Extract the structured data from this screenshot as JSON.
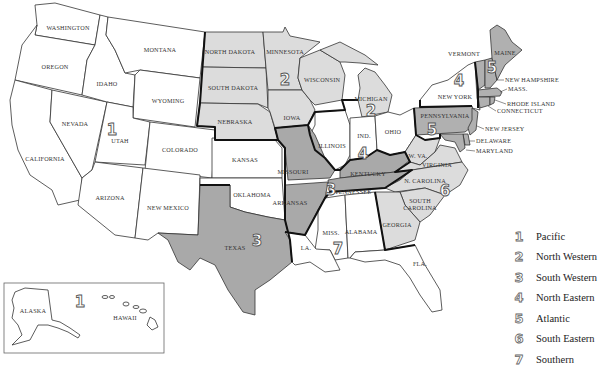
{
  "map": {
    "title": "Map of the United States showing seven regions",
    "colors": {
      "region_1": "#ffffff",
      "region_2": "#dcdcdc",
      "region_3": "#a9a9a9",
      "region_4": "#ffffff",
      "region_5": "#b0b0b0",
      "region_6": "#dcdcdc",
      "region_7": "#ffffff",
      "border": "#111111",
      "state_line": "#333333"
    },
    "states": [
      {
        "name": "WASHINGTON",
        "region": 1
      },
      {
        "name": "OREGON",
        "region": 1
      },
      {
        "name": "CALIFORNIA",
        "region": 1
      },
      {
        "name": "IDAHO",
        "region": 1
      },
      {
        "name": "NEVADA",
        "region": 1
      },
      {
        "name": "UTAH",
        "region": 1
      },
      {
        "name": "MONTANA",
        "region": 1
      },
      {
        "name": "WYOMING",
        "region": 1
      },
      {
        "name": "COLORADO",
        "region": 1
      },
      {
        "name": "ARIZONA",
        "region": 1
      },
      {
        "name": "NEW MEXICO",
        "region": 1
      },
      {
        "name": "KANSAS",
        "region": 1
      },
      {
        "name": "OKLAHOMA",
        "region": 1
      },
      {
        "name": "ALASKA",
        "region": 1
      },
      {
        "name": "HAWAII",
        "region": 1
      },
      {
        "name": "NORTH DAKOTA",
        "region": 2
      },
      {
        "name": "SOUTH DAKOTA",
        "region": 2
      },
      {
        "name": "NEBRASKA",
        "region": 2
      },
      {
        "name": "MINNESOTA",
        "region": 2
      },
      {
        "name": "IOWA",
        "region": 2
      },
      {
        "name": "WISCONSIN",
        "region": 2
      },
      {
        "name": "MICHIGAN",
        "region": 2
      },
      {
        "name": "TEXAS",
        "region": 3
      },
      {
        "name": "MISSOURI",
        "region": 3
      },
      {
        "name": "ARKANSAS",
        "region": 3
      },
      {
        "name": "KENTUCKY",
        "region": 3
      },
      {
        "name": "TENNESSEE",
        "region": 3
      },
      {
        "name": "ILLINOIS",
        "region": 4
      },
      {
        "name": "IND.",
        "region": 4
      },
      {
        "name": "OHIO",
        "region": 4
      },
      {
        "name": "NEW YORK",
        "region": 4
      },
      {
        "name": "VERMONT",
        "region": 5
      },
      {
        "name": "MAINE",
        "region": 5
      },
      {
        "name": "NEW HAMPSHIRE",
        "region": 5
      },
      {
        "name": "MASS.",
        "region": 5
      },
      {
        "name": "RHODE ISLAND",
        "region": 5
      },
      {
        "name": "CONNECTICUT",
        "region": 5
      },
      {
        "name": "PENNSYLVANIA",
        "region": 5
      },
      {
        "name": "NEW JERSEY",
        "region": 5
      },
      {
        "name": "DELAWARE",
        "region": 5
      },
      {
        "name": "MARYLAND",
        "region": 5
      },
      {
        "name": "W. VA.",
        "region": 6
      },
      {
        "name": "VIRGINIA",
        "region": 6
      },
      {
        "name": "N. CAROLINA",
        "region": 6
      },
      {
        "name": "SOUTH CAROLINA",
        "region": 6
      },
      {
        "name": "GEORGIA",
        "region": 6
      },
      {
        "name": "MISS.",
        "region": 7
      },
      {
        "name": "ALABAMA",
        "region": 7
      },
      {
        "name": "LA.",
        "region": 7
      },
      {
        "name": "FLA.",
        "region": 7
      }
    ],
    "labels": {
      "washington": "WASHINGTON",
      "oregon": "OREGON",
      "california": "CALIFORNIA",
      "idaho": "IDAHO",
      "nevada": "NEVADA",
      "utah": "UTAH",
      "montana": "MONTANA",
      "wyoming": "WYOMING",
      "colorado": "COLORADO",
      "arizona": "ARIZONA",
      "new_mexico": "NEW MEXICO",
      "kansas": "KANSAS",
      "oklahoma": "OKLAHOMA",
      "texas": "TEXAS",
      "north_dakota": "NORTH DAKOTA",
      "south_dakota": "SOUTH DAKOTA",
      "nebraska": "NEBRASKA",
      "minnesota": "MINNESOTA",
      "iowa": "IOWA",
      "wisconsin": "WISCONSIN",
      "michigan": "MICHIGAN",
      "missouri": "MISSOURI",
      "arkansas": "ARKANSAS",
      "kentucky": "KENTUCKY",
      "tennessee": "TENNESSEE",
      "illinois": "ILLINOIS",
      "indiana": "IND.",
      "ohio": "OHIO",
      "new_york": "NEW YORK",
      "vermont": "VERMONT",
      "maine": "MAINE",
      "new_hampshire": "NEW HAMPSHIRE",
      "mass": "MASS.",
      "rhode_island": "RHODE ISLAND",
      "connecticut": "CONNECTICUT",
      "pennsylvania": "PENNSYLVANIA",
      "new_jersey": "NEW JERSEY",
      "delaware": "DELAWARE",
      "maryland": "MARYLAND",
      "west_virginia": "W. VA.",
      "virginia": "VIRGINIA",
      "north_carolina": "N. CAROLINA",
      "south_carolina_1": "SOUTH",
      "south_carolina_2": "CAROLINA",
      "georgia": "GEORGIA",
      "mississippi": "MISS.",
      "alabama": "ALABAMA",
      "louisiana": "LA.",
      "florida": "FLA.",
      "alaska": "ALASKA",
      "hawaii": "HAWAII"
    },
    "region_markers": {
      "r1_main": "1",
      "r1_inset": "1",
      "r2_west": "2",
      "r2_east": "2",
      "r3_texas": "3",
      "r3_tn": "3",
      "r4_ny": "4",
      "r4_ind": "4",
      "r5_ne": "5",
      "r5_pa": "5",
      "r6": "6",
      "r7": "7"
    }
  },
  "legend": {
    "items": [
      {
        "number": "1",
        "label": "Pacific"
      },
      {
        "number": "2",
        "label": "North Western"
      },
      {
        "number": "3",
        "label": "South Western"
      },
      {
        "number": "4",
        "label": "North Eastern"
      },
      {
        "number": "5",
        "label": "Atlantic"
      },
      {
        "number": "6",
        "label": "South Eastern"
      },
      {
        "number": "7",
        "label": "Southern"
      }
    ]
  }
}
